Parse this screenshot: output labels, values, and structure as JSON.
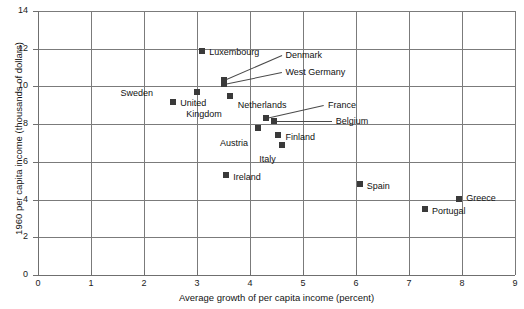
{
  "chart_data": {
    "type": "scatter",
    "title": "",
    "xlabel": "Average growth of per capita income (percent)",
    "ylabel": "1960 per capita income (thousands of dollars)",
    "xlim": [
      0,
      9
    ],
    "ylim": [
      0,
      14
    ],
    "xticks": [
      0,
      1,
      2,
      3,
      4,
      5,
      6,
      7,
      8,
      9
    ],
    "yticks": [
      0,
      2,
      4,
      6,
      8,
      10,
      12,
      14
    ],
    "grid": true,
    "legend": "none",
    "points": [
      {
        "label": "Luxembourg",
        "x": 3.1,
        "y": 11.9,
        "label_dx": 7,
        "label_dy": -4,
        "leader": false
      },
      {
        "label": "Denmark",
        "x": 3.5,
        "y": 10.35,
        "label_dx": 62,
        "label_dy": -30,
        "leader": true
      },
      {
        "label": "West Germany",
        "x": 3.5,
        "y": 10.15,
        "label_dx": 62,
        "label_dy": -17,
        "leader": true
      },
      {
        "label": "Sweden",
        "x": 3.0,
        "y": 9.7,
        "label_dx": -44,
        "label_dy": -4,
        "leader": false
      },
      {
        "label": "Netherlands",
        "x": 3.62,
        "y": 9.5,
        "label_dx": 8,
        "label_dy": 4,
        "leader": false
      },
      {
        "label": "United",
        "x": 2.55,
        "y": 9.15,
        "label_dx": 7,
        "label_dy": -4,
        "leader": false
      },
      {
        "label": "Kingdom",
        "x": null,
        "y": null,
        "label_dx": 0,
        "label_dy": 0,
        "leader": false
      },
      {
        "label": "France",
        "x": 4.3,
        "y": 8.35,
        "label_dx": 62,
        "label_dy": -18,
        "leader": true
      },
      {
        "label": "Belgium",
        "x": 4.45,
        "y": 8.18,
        "label_dx": 62,
        "label_dy": -5,
        "leader": true
      },
      {
        "label": "Austria",
        "x": 4.15,
        "y": 7.8,
        "label_dx": -10,
        "label_dy": 10,
        "leader": false
      },
      {
        "label": "Finland",
        "x": 4.52,
        "y": 7.42,
        "label_dx": 8,
        "label_dy": -3,
        "leader": false
      },
      {
        "label": "Italy",
        "x": 4.6,
        "y": 6.92,
        "label_dx": -6,
        "label_dy": 9,
        "leader": false
      },
      {
        "label": "Ireland",
        "x": 3.55,
        "y": 5.32,
        "label_dx": 7,
        "label_dy": -3,
        "leader": false
      },
      {
        "label": "Spain",
        "x": 6.07,
        "y": 4.85,
        "label_dx": 7,
        "label_dy": -3,
        "leader": false
      },
      {
        "label": "Greece",
        "x": 7.95,
        "y": 4.05,
        "label_dx": 7,
        "label_dy": -6,
        "leader": false
      },
      {
        "label": "Portugal",
        "x": 7.3,
        "y": 3.52,
        "label_dx": 7,
        "label_dy": -3,
        "leader": false
      }
    ],
    "multiline_labels": [
      {
        "line1": "United",
        "line2": "Kingdom"
      }
    ]
  },
  "axes": {
    "x_tick_labels": [
      "0",
      "1",
      "2",
      "3",
      "4",
      "5",
      "6",
      "7",
      "8",
      "9"
    ],
    "y_tick_labels": [
      "0",
      "2",
      "4",
      "6",
      "8",
      "10",
      "12",
      "14"
    ],
    "x_title": "Average growth of per capita income (percent)",
    "y_title": "1960 per capita income (thousands of dollars)"
  },
  "colors": {
    "marker": "#3a3a3a",
    "grid": "#7b7b7b",
    "axis": "#6f6f6f",
    "text": "#111111",
    "background": "#ffffff"
  }
}
